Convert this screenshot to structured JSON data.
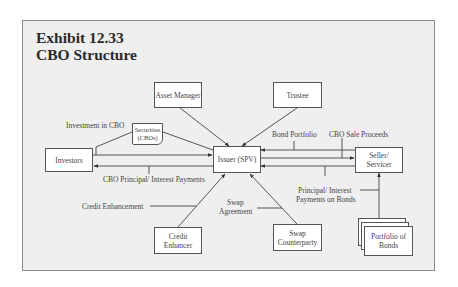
{
  "exhibit": {
    "number": "Exhibit 12.33",
    "title": "CBO Structure"
  },
  "nodes": {
    "asset_manager": "Asset Manager",
    "trustee": "Trustee",
    "investors": "Investors",
    "securities": "Securities (CBOs)",
    "issuer": "Issuer (SPV)",
    "seller_servicer": "Seller/ Servicer",
    "credit_enhancer": "Credit Enhancer",
    "swap_counterparty": "Swap Counterparty",
    "portfolio_of_bonds": "Portfolio of Bonds"
  },
  "flows": {
    "investment_in_cbo": "Investment in CBO",
    "cbo_principal_interest": "CBO Principal/ Interest Payments",
    "bond_portfolio": "Bond Portfolio",
    "cbo_sale_proceeds": "CBO Sale Proceeds",
    "principal_interest_on_bonds_1": "Principal/ Interest",
    "principal_interest_on_bonds_2": "Payments on Bonds",
    "credit_enhancement": "Credit Enhancement",
    "swap_agreement_1": "Swap",
    "swap_agreement_2": "Agreement"
  }
}
